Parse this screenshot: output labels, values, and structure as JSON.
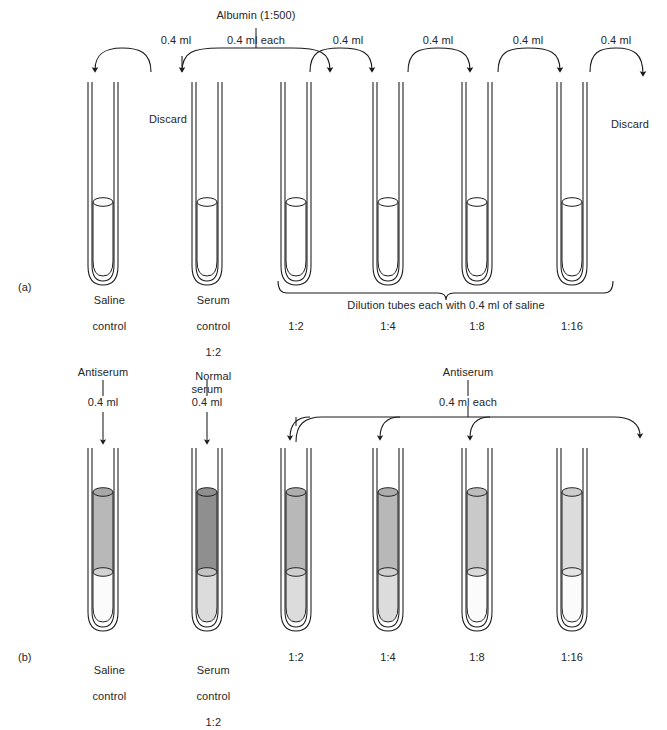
{
  "figure": {
    "panels": [
      {
        "tag": "(a)",
        "tag_x": 18,
        "tag_y": 281,
        "tubes": [
          {
            "label_lines": [
              "Saline",
              "control"
            ],
            "x": 103,
            "fill": "clear",
            "upper": null
          },
          {
            "label_lines": [
              "Serum",
              "control",
              "1:2"
            ],
            "x": 207,
            "fill": "clear",
            "upper": null
          },
          {
            "label_lines": [
              "1:2"
            ],
            "x": 296,
            "fill": "clear",
            "upper": null
          },
          {
            "label_lines": [
              "1:4"
            ],
            "x": 388,
            "fill": "clear",
            "upper": null
          },
          {
            "label_lines": [
              "1:8"
            ],
            "x": 477,
            "fill": "clear",
            "upper": null
          },
          {
            "label_lines": [
              "1:16"
            ],
            "x": 572,
            "fill": "clear",
            "upper": null
          }
        ],
        "transfer_labels": [
          {
            "text": "0.4 ml",
            "x": 176,
            "y": 34
          },
          {
            "text": "0.4 ml each",
            "x": 256,
            "y": 34
          },
          {
            "text": "0.4 ml",
            "x": 348,
            "y": 34
          },
          {
            "text": "0.4 ml",
            "x": 438,
            "y": 34
          },
          {
            "text": "0.4 ml",
            "x": 528,
            "y": 34
          },
          {
            "text": "0.4 ml",
            "x": 616,
            "y": 34
          }
        ],
        "source_label": {
          "text": "Albumin (1:500)",
          "x": 256,
          "y": 9
        },
        "discard_labels": [
          {
            "text": "Discard",
            "x": 168,
            "y": 113
          },
          {
            "text": "Discard",
            "x": 630,
            "y": 118
          }
        ],
        "brace_label": {
          "text": "Dilution tubes each with 0.4 ml of saline",
          "x": 446,
          "y": 288
        }
      },
      {
        "tag": "(b)",
        "tag_x": 18,
        "tag_y": 651,
        "tubes": [
          {
            "label_lines": [
              "Saline",
              "control"
            ],
            "x": 103,
            "fill": "two-layer",
            "upper": "mid",
            "lower": "white"
          },
          {
            "label_lines": [
              "Serum",
              "control",
              "1:2"
            ],
            "x": 207,
            "fill": "two-layer",
            "upper": "dark",
            "lower": "light"
          },
          {
            "label_lines": [
              "1:2"
            ],
            "x": 296,
            "fill": "two-layer",
            "upper": "mid",
            "lower": "light"
          },
          {
            "label_lines": [
              "1:4"
            ],
            "x": 388,
            "fill": "two-layer",
            "upper": "mid",
            "lower": "light"
          },
          {
            "label_lines": [
              "1:8"
            ],
            "x": 477,
            "fill": "two-layer",
            "upper": "midlight",
            "lower": "white"
          },
          {
            "label_lines": [
              "1:16"
            ],
            "x": 572,
            "fill": "two-layer",
            "upper": "light",
            "lower": "white"
          }
        ],
        "addition_labels": [
          {
            "text": "Antiserum",
            "x": 103,
            "y": 366
          },
          {
            "text": "0.4 ml",
            "x": 103,
            "y": 396
          },
          {
            "text": "Normal\nserum",
            "x": 207,
            "y": 357
          },
          {
            "text": "0.4 ml",
            "x": 207,
            "y": 396
          },
          {
            "text": "Antiserum",
            "x": 468,
            "y": 366
          },
          {
            "text": "0.4 ml each",
            "x": 468,
            "y": 396
          }
        ]
      }
    ],
    "colors": {
      "stroke": "#1a1a1a",
      "dark": "#8f8f8f",
      "mid": "#b8b8b8",
      "midlight": "#c9c9c9",
      "light": "#dcdcdc",
      "white": "#fbfbfb",
      "meniscus_dark": "#a8a8a8",
      "meniscus_light": "#e4e4e4"
    }
  }
}
